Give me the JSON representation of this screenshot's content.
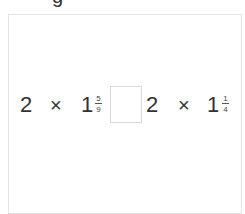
{
  "heading": {
    "clipped_text": "g"
  },
  "comparison": {
    "left": {
      "factor": "2",
      "operator": "×",
      "whole": "1",
      "numerator": "5",
      "denominator": "9"
    },
    "answer_box": {
      "value": ""
    },
    "right": {
      "factor": "2",
      "operator": "×",
      "whole": "1",
      "numerator": "1",
      "denominator": "4"
    }
  }
}
